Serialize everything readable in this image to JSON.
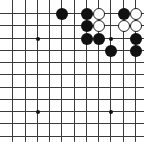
{
  "board": {
    "type": "go-board-fragment",
    "visible_cols": 11,
    "visible_rows": 11,
    "origin_px": [
      12.25,
      13
    ],
    "spacing_px": 12.25,
    "colors": {
      "black": "#111111",
      "white": "#ffffff",
      "line": "#3a3a3a",
      "background": "#ffffff"
    },
    "star_points": [
      [
        2,
        2
      ],
      [
        8,
        2
      ],
      [
        2,
        8
      ],
      [
        8,
        8
      ]
    ],
    "stones": [
      {
        "col": 4,
        "row": 0,
        "color": "black"
      },
      {
        "col": 6,
        "row": 0,
        "color": "black"
      },
      {
        "col": 7,
        "row": 0,
        "color": "white"
      },
      {
        "col": 9,
        "row": 0,
        "color": "black"
      },
      {
        "col": 10,
        "row": 0,
        "color": "white"
      },
      {
        "col": 6,
        "row": 1,
        "color": "black"
      },
      {
        "col": 7,
        "row": 1,
        "color": "white"
      },
      {
        "col": 9,
        "row": 1,
        "color": "white"
      },
      {
        "col": 10,
        "row": 1,
        "color": "white"
      },
      {
        "col": 6,
        "row": 2,
        "color": "black"
      },
      {
        "col": 7,
        "row": 2,
        "color": "black"
      },
      {
        "col": 10,
        "row": 2,
        "color": "black"
      },
      {
        "col": 8,
        "row": 3,
        "color": "black"
      },
      {
        "col": 10,
        "row": 3,
        "color": "black"
      }
    ]
  }
}
